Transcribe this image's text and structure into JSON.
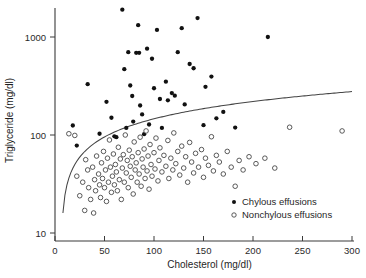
{
  "chart_data": {
    "type": "scatter",
    "title": "",
    "xlabel": "Cholesterol (mg/dl)",
    "ylabel": "Triglyceride (mg/dl)",
    "xscale": "linear",
    "yscale": "log",
    "xlim": [
      0,
      300
    ],
    "ylim": [
      7,
      3000
    ],
    "xticks": [
      0,
      50,
      100,
      150,
      200,
      250,
      300
    ],
    "xticklabels": [
      "0",
      "50",
      "100",
      "150",
      "200",
      "250",
      "300"
    ],
    "yticks": [
      10,
      100,
      1000
    ],
    "yticklabels": [
      "10",
      "100",
      "1000"
    ],
    "grid": false,
    "legend_position": "lower-right",
    "series": [
      {
        "name": "Chylous effusions",
        "marker": "filled-circle",
        "color": "#111111",
        "points": [
          [
            18,
            125
          ],
          [
            22,
            78
          ],
          [
            33,
            330
          ],
          [
            45,
            103
          ],
          [
            52,
            218
          ],
          [
            57,
            150
          ],
          [
            60,
            97
          ],
          [
            62,
            95
          ],
          [
            68,
            1900
          ],
          [
            70,
            470
          ],
          [
            72,
            118
          ],
          [
            74,
            700
          ],
          [
            76,
            320
          ],
          [
            78,
            250
          ],
          [
            79,
            137
          ],
          [
            82,
            690
          ],
          [
            84,
            1320
          ],
          [
            85,
            690
          ],
          [
            86,
            200
          ],
          [
            88,
            162
          ],
          [
            90,
            102
          ],
          [
            93,
            760
          ],
          [
            95,
            128
          ],
          [
            98,
            600
          ],
          [
            100,
            300
          ],
          [
            103,
            1180
          ],
          [
            106,
            233
          ],
          [
            108,
            118
          ],
          [
            112,
            350
          ],
          [
            114,
            226
          ],
          [
            118,
            268
          ],
          [
            121,
            252
          ],
          [
            124,
            700
          ],
          [
            128,
            1230
          ],
          [
            131,
            205
          ],
          [
            136,
            530
          ],
          [
            140,
            480
          ],
          [
            144,
            1560
          ],
          [
            150,
            126
          ],
          [
            152,
            310
          ],
          [
            158,
            395
          ],
          [
            163,
            148
          ],
          [
            170,
            172
          ],
          [
            182,
            119
          ],
          [
            215,
            1000
          ]
        ]
      },
      {
        "name": "Nonchylous effusions",
        "marker": "open-circle",
        "color": "#3d3d3d",
        "points": [
          [
            14,
            103
          ],
          [
            20,
            99
          ],
          [
            22,
            38
          ],
          [
            25,
            24
          ],
          [
            28,
            33
          ],
          [
            30,
            17
          ],
          [
            31,
            56
          ],
          [
            33,
            44
          ],
          [
            34,
            29
          ],
          [
            36,
            22
          ],
          [
            38,
            47
          ],
          [
            39,
            16
          ],
          [
            40,
            35
          ],
          [
            41,
            27
          ],
          [
            42,
            61
          ],
          [
            44,
            40
          ],
          [
            45,
            31
          ],
          [
            46,
            23
          ],
          [
            47,
            52
          ],
          [
            48,
            36
          ],
          [
            49,
            68
          ],
          [
            50,
            29
          ],
          [
            51,
            44
          ],
          [
            52,
            21
          ],
          [
            53,
            58
          ],
          [
            54,
            33
          ],
          [
            55,
            89
          ],
          [
            56,
            47
          ],
          [
            57,
            26
          ],
          [
            58,
            38
          ],
          [
            59,
            64
          ],
          [
            60,
            31
          ],
          [
            61,
            50
          ],
          [
            62,
            42
          ],
          [
            63,
            27
          ],
          [
            64,
            75
          ],
          [
            65,
            35
          ],
          [
            66,
            57
          ],
          [
            67,
            22
          ],
          [
            68,
            46
          ],
          [
            69,
            63
          ],
          [
            70,
            33
          ],
          [
            71,
            100
          ],
          [
            72,
            41
          ],
          [
            73,
            55
          ],
          [
            74,
            29
          ],
          [
            75,
            70
          ],
          [
            76,
            48
          ],
          [
            77,
            37
          ],
          [
            78,
            60
          ],
          [
            79,
            25
          ],
          [
            80,
            85
          ],
          [
            81,
            44
          ],
          [
            82,
            52
          ],
          [
            83,
            33
          ],
          [
            84,
            66
          ],
          [
            85,
            40
          ],
          [
            86,
            95
          ],
          [
            87,
            30
          ],
          [
            88,
            57
          ],
          [
            89,
            47
          ],
          [
            90,
            72
          ],
          [
            91,
            36
          ],
          [
            92,
            110
          ],
          [
            93,
            43
          ],
          [
            94,
            61
          ],
          [
            95,
            28
          ],
          [
            96,
            80
          ],
          [
            97,
            50
          ],
          [
            98,
            38
          ],
          [
            100,
            66
          ],
          [
            101,
            45
          ],
          [
            102,
            93
          ],
          [
            104,
            34
          ],
          [
            105,
            55
          ],
          [
            106,
            74
          ],
          [
            108,
            42
          ],
          [
            110,
            62
          ],
          [
            112,
            48
          ],
          [
            114,
            88
          ],
          [
            115,
            36
          ],
          [
            117,
            58
          ],
          [
            119,
            44
          ],
          [
            120,
            105
          ],
          [
            122,
            51
          ],
          [
            124,
            68
          ],
          [
            126,
            39
          ],
          [
            128,
            77
          ],
          [
            130,
            46
          ],
          [
            132,
            60
          ],
          [
            134,
            33
          ],
          [
            136,
            84
          ],
          [
            138,
            53
          ],
          [
            140,
            41
          ],
          [
            142,
            65
          ],
          [
            145,
            47
          ],
          [
            148,
            71
          ],
          [
            150,
            37
          ],
          [
            152,
            58
          ],
          [
            155,
            49
          ],
          [
            158,
            96
          ],
          [
            160,
            43
          ],
          [
            163,
            62
          ],
          [
            166,
            53
          ],
          [
            170,
            40
          ],
          [
            174,
            68
          ],
          [
            178,
            47
          ],
          [
            182,
            30
          ],
          [
            186,
            55
          ],
          [
            190,
            44
          ],
          [
            196,
            60
          ],
          [
            203,
            51
          ],
          [
            212,
            58
          ],
          [
            222,
            46
          ],
          [
            237,
            120
          ],
          [
            290,
            110
          ]
        ]
      }
    ],
    "annotations": [
      {
        "name": "discriminant-boundary-curve",
        "description": "curved separating line rising from lower-left to upper-right"
      }
    ]
  },
  "legend": {
    "entries": [
      {
        "label": "Chylous effusions",
        "marker": "filled-circle"
      },
      {
        "label": "Nonchylous effusions",
        "marker": "open-circle"
      }
    ]
  }
}
